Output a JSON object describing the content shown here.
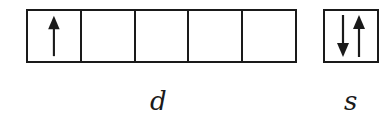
{
  "diagram": {
    "type": "orbital-box-diagram",
    "d_orbital": {
      "label": "d",
      "cells": [
        {
          "electrons": [
            "up"
          ]
        },
        {
          "electrons": []
        },
        {
          "electrons": []
        },
        {
          "electrons": []
        },
        {
          "electrons": []
        }
      ]
    },
    "s_orbital": {
      "label": "s",
      "cells": [
        {
          "electrons": [
            "down",
            "up"
          ]
        }
      ]
    },
    "colors": {
      "line": "#1a1a1a",
      "background": "#ffffff"
    }
  }
}
